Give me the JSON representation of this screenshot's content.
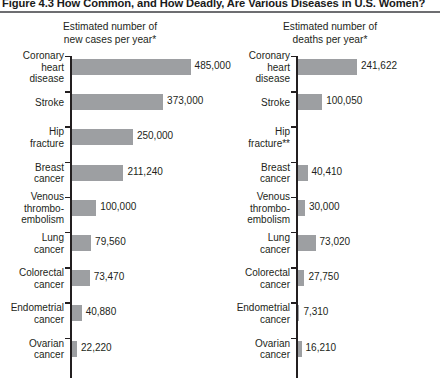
{
  "figure": {
    "title": "Figure 4.3  How Common, and How Deadly, Are Various Diseases in U.S. Women?",
    "rule_color": "#6d6e71",
    "bar_color": "#9d9fa2",
    "text_color": "#231f20"
  },
  "panels": [
    {
      "header_line1": "Estimated number of",
      "header_line2": "new cases per year*",
      "rows": [
        {
          "label_lines": [
            "Coronary",
            "heart",
            "disease"
          ],
          "value": 485000,
          "value_label": "485,000"
        },
        {
          "label_lines": [
            "Stroke"
          ],
          "value": 373000,
          "value_label": "373,000"
        },
        {
          "label_lines": [
            "Hip",
            "fracture"
          ],
          "value": 250000,
          "value_label": "250,000"
        },
        {
          "label_lines": [
            "Breast",
            "cancer"
          ],
          "value": 211240,
          "value_label": "211,240"
        },
        {
          "label_lines": [
            "Venous",
            "thrombo-",
            "embolism"
          ],
          "value": 100000,
          "value_label": "100,000"
        },
        {
          "label_lines": [
            "Lung",
            "cancer"
          ],
          "value": 79560,
          "value_label": "79,560"
        },
        {
          "label_lines": [
            "Colorectal",
            "cancer"
          ],
          "value": 73470,
          "value_label": "73,470"
        },
        {
          "label_lines": [
            "Endometrial",
            "cancer"
          ],
          "value": 40880,
          "value_label": "40,880"
        },
        {
          "label_lines": [
            "Ovarian",
            "cancer"
          ],
          "value": 22220,
          "value_label": "22,220"
        }
      ]
    },
    {
      "header_line1": "Estimated number of",
      "header_line2": "deaths per year*",
      "rows": [
        {
          "label_lines": [
            "Coronary",
            "heart",
            "disease"
          ],
          "value": 241622,
          "value_label": "241,622"
        },
        {
          "label_lines": [
            "Stroke"
          ],
          "value": 100050,
          "value_label": "100,050"
        },
        {
          "label_lines": [
            "Hip",
            "fracture**"
          ],
          "value": 0,
          "value_label": ""
        },
        {
          "label_lines": [
            "Breast",
            "cancer"
          ],
          "value": 40410,
          "value_label": "40,410"
        },
        {
          "label_lines": [
            "Venous",
            "thrombo-",
            "embolism"
          ],
          "value": 30000,
          "value_label": "30,000"
        },
        {
          "label_lines": [
            "Lung",
            "cancer"
          ],
          "value": 73020,
          "value_label": "73,020"
        },
        {
          "label_lines": [
            "Colorectal",
            "cancer"
          ],
          "value": 27750,
          "value_label": "27,750"
        },
        {
          "label_lines": [
            "Endometrial",
            "cancer"
          ],
          "value": 7310,
          "value_label": "7,310"
        },
        {
          "label_lines": [
            "Ovarian",
            "cancer"
          ],
          "value": 16210,
          "value_label": "16,210"
        }
      ]
    }
  ],
  "chart_data": {
    "type": "bar",
    "title": "Figure 4.3  How Common, and How Deadly, Are Various Diseases in U.S. Women?",
    "orientation": "horizontal",
    "grid": false,
    "legend": null,
    "categories": [
      "Coronary heart disease",
      "Stroke",
      "Hip fracture",
      "Breast cancer",
      "Venous thromboembolism",
      "Lung cancer",
      "Colorectal cancer",
      "Endometrial cancer",
      "Ovarian cancer"
    ],
    "series": [
      {
        "name": "Estimated number of new cases per year*",
        "values": [
          485000,
          373000,
          250000,
          211240,
          100000,
          79560,
          73470,
          40880,
          22220
        ],
        "labels": [
          "485,000",
          "373,000",
          "250,000",
          "211,240",
          "100,000",
          "79,560",
          "73,470",
          "40,880",
          "22,220"
        ],
        "xlabel": "",
        "ylabel": "",
        "xlim": [
          0,
          485000
        ]
      },
      {
        "name": "Estimated number of deaths per year*",
        "values": [
          241622,
          100050,
          null,
          40410,
          30000,
          73020,
          27750,
          7310,
          16210
        ],
        "labels": [
          "241,622",
          "100,050",
          "",
          "40,410",
          "30,000",
          "73,020",
          "27,750",
          "7,310",
          "16,210"
        ],
        "xlabel": "",
        "ylabel": "",
        "xlim": [
          0,
          485000
        ]
      }
    ],
    "notes": [
      "Hip fracture** has no deaths-per-year bar or value shown"
    ],
    "axis_scale_units_per_pixel": 4075
  }
}
